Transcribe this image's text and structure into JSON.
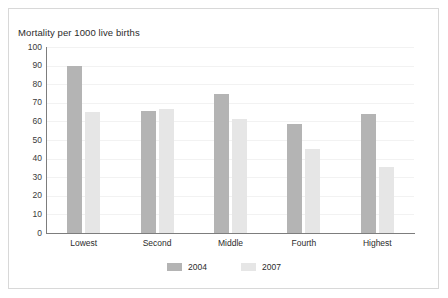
{
  "chart_data": {
    "type": "bar",
    "title": "Mortality per 1000 live births",
    "xlabel": "",
    "ylabel": "",
    "ylim": [
      0,
      100
    ],
    "yticks": [
      0,
      10,
      20,
      30,
      40,
      50,
      60,
      70,
      80,
      90,
      100
    ],
    "ytick_labels": [
      "0",
      "10",
      "20",
      "30",
      "40",
      "50",
      "60",
      "70",
      "80",
      "90",
      "100"
    ],
    "grid": true,
    "legend_position": "bottom-center",
    "categories": [
      "Lowest",
      "Second",
      "Middle",
      "Fourth",
      "Highest"
    ],
    "series": [
      {
        "name": "2004",
        "color": "#b4b4b4",
        "values": [
          90,
          65.5,
          75,
          58.5,
          64
        ]
      },
      {
        "name": "2007",
        "color": "#e6e6e6",
        "values": [
          65,
          66.5,
          61.5,
          45,
          35.5
        ]
      }
    ]
  },
  "legend": {
    "items": [
      {
        "label": "2004"
      },
      {
        "label": "2007"
      }
    ]
  },
  "colors": {
    "series_2004": "#b4b4b4",
    "series_2007": "#e6e6e6",
    "axis": "#7d7d7d",
    "gridline": "#f2f2f2",
    "frame": "#d8d8d8",
    "text": "#2b2b2b"
  }
}
